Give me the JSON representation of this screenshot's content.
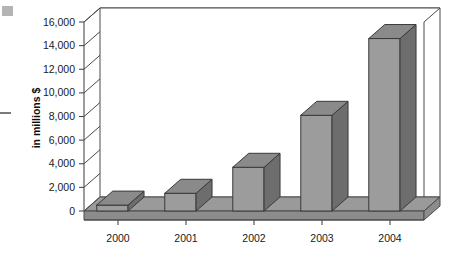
{
  "chart_data": {
    "type": "bar",
    "title": "",
    "subtitle": "",
    "xlabel": "",
    "ylabel": "in millions $",
    "categories": [
      "2000",
      "2001",
      "2002",
      "2003",
      "2004"
    ],
    "values": [
      500,
      1500,
      3700,
      8100,
      14600
    ],
    "series": [
      {
        "name": "in millions $",
        "values": [
          500,
          1500,
          3700,
          8100,
          14600
        ]
      }
    ],
    "ylim": [
      0,
      16000
    ],
    "ytick_values": [
      0,
      2000,
      4000,
      6000,
      8000,
      10000,
      12000,
      14000,
      16000
    ],
    "ytick_labels": [
      "0",
      "2,000",
      "4,000",
      "6,000",
      "8,000",
      "10,000",
      "12,000",
      "14,000",
      "16,000"
    ],
    "grid": true,
    "grid_axis": "y",
    "legend": false,
    "legend_position": "none",
    "style": "3d-column",
    "annotations": [],
    "colors": {
      "bar_front": "#9c9c9c",
      "bar_side": "#6d6d6d",
      "bar_top": "#8a8a8a",
      "axis": "#4a4a4a",
      "floor": "#9a9a9a",
      "text": "#1a1a1a",
      "background": "#ffffff"
    }
  },
  "artifacts": {
    "corner_mark": "scan-artifact-square",
    "edge_mark": "scan-artifact-dash"
  }
}
